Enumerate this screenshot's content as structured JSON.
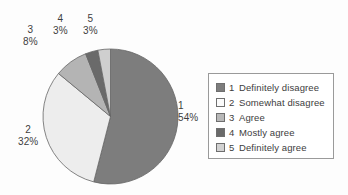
{
  "chart_data": {
    "type": "pie",
    "title": "",
    "categories": [
      "1",
      "2",
      "3",
      "4",
      "5"
    ],
    "labels": [
      "Definitely disagree",
      "Somewhat disagree",
      "Agree",
      "Mostly agree",
      "Definitely agree"
    ],
    "values": [
      54,
      32,
      8,
      3,
      3
    ],
    "value_suffix": "%",
    "start_angle_deg": 0,
    "direction": "clockwise",
    "legend_position": "right",
    "grid": false,
    "colors": [
      "#7d7d7d",
      "#ededed",
      "#b4b4b4",
      "#6a6a6a",
      "#cfcfcf"
    ],
    "slice_border_color": "#666666",
    "slices": [
      {
        "key": "1",
        "label": "Definitely disagree",
        "value": 54,
        "display_value": "54%",
        "color": "#7d7d7d"
      },
      {
        "key": "2",
        "label": "Somewhat disagree",
        "value": 32,
        "display_value": "32%",
        "color": "#ededed"
      },
      {
        "key": "3",
        "label": "Agree",
        "value": 8,
        "display_value": "8%",
        "color": "#b4b4b4"
      },
      {
        "key": "4",
        "label": "Mostly agree",
        "value": 3,
        "display_value": "3%",
        "color": "#6a6a6a"
      },
      {
        "key": "5",
        "label": "Definitely agree",
        "value": 3,
        "display_value": "3%",
        "color": "#cfcfcf"
      }
    ]
  },
  "callouts": [
    {
      "cat": "1",
      "pct": "54%"
    },
    {
      "cat": "2",
      "pct": "32%"
    },
    {
      "cat": "3",
      "pct": "8%"
    },
    {
      "cat": "4",
      "pct": "3%"
    },
    {
      "cat": "5",
      "pct": "3%"
    }
  ],
  "legend": {
    "rows": [
      {
        "key": "1",
        "label": "Definitely disagree",
        "color": "#7d7d7d"
      },
      {
        "key": "2",
        "label": "Somewhat disagree",
        "color": "#fbfbfb"
      },
      {
        "key": "3",
        "label": "Agree",
        "color": "#b8b8b8"
      },
      {
        "key": "4",
        "label": "Mostly agree",
        "color": "#6a6a6a"
      },
      {
        "key": "5",
        "label": "Definitely agree",
        "color": "#d2d2d2"
      }
    ]
  },
  "style": {
    "background": "#fdfdfd",
    "text_color": "#3d3d3d",
    "legend_border": "#9a9a9a"
  }
}
